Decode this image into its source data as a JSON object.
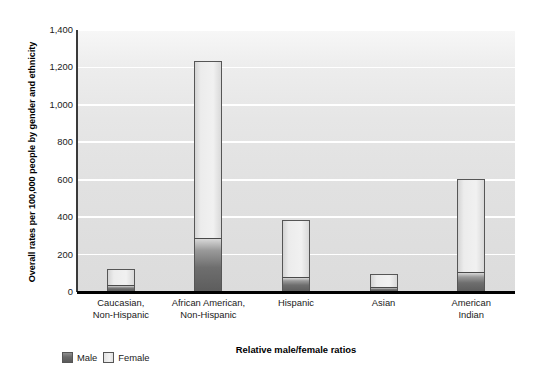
{
  "chart_data": {
    "type": "bar",
    "stacked": true,
    "title": "",
    "xlabel": "Relative male/female ratios",
    "ylabel": "Overall rates per 100,000 people by gender and ethnicity",
    "categories": [
      "Caucasian,\nNon-Hispanic",
      "African American,\nNon-Hispanic",
      "Hispanic",
      "Asian",
      "American\nIndian"
    ],
    "category_lines": [
      [
        "Caucasian,",
        "Non-Hispanic"
      ],
      [
        "African American,",
        "Non-Hispanic"
      ],
      [
        "Hispanic",
        ""
      ],
      [
        "Asian",
        ""
      ],
      [
        "American",
        "Indian"
      ]
    ],
    "series": [
      {
        "name": "Male",
        "values": [
          35,
          290,
          80,
          25,
          105
        ]
      },
      {
        "name": "Female",
        "values": [
          90,
          945,
          305,
          70,
          500
        ]
      }
    ],
    "totals": [
      125,
      1235,
      385,
      95,
      605
    ],
    "ylim": [
      0,
      1400
    ],
    "yticks": [
      0,
      200,
      400,
      600,
      800,
      1000,
      1200,
      1400
    ],
    "ytick_labels": [
      "0",
      "200",
      "400",
      "600",
      "800",
      "1,000",
      "1,200",
      "1,400"
    ],
    "grid": true,
    "legend_position": "bottom-left",
    "legend": [
      "Male",
      "Female"
    ],
    "colors": {
      "male": "#6a6a6a",
      "female": "#eeeeee",
      "plot_background": "#e3e3e3",
      "gridline": "#ffffff",
      "axis": "#000000",
      "text": "#1a1a1a"
    }
  }
}
